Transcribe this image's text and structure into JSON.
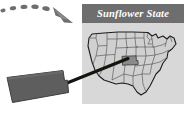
{
  "figure": {
    "kind": "state-callout-map-illustration",
    "background_color": "#ffffff",
    "width": 187,
    "height": 122
  },
  "panel": {
    "name": "sunflower-state-panel",
    "background_color": "#d8d8d8",
    "x": 82,
    "y": 4,
    "width": 102,
    "height": 100
  },
  "title_bar": {
    "label": "Sunflower State",
    "background_color": "#6e6e6e",
    "text_color": "#ffffff",
    "x": 82,
    "y": 4,
    "width": 102,
    "height": 19
  },
  "map": {
    "name": "united-states-map",
    "fill_color": "#d0d0d0",
    "outline_color": "#3a3a3a",
    "border_color": "#1c1c1c",
    "highlight": {
      "state": "Kansas",
      "fill_color": "#8a8a8a",
      "x": 122,
      "y": 56,
      "width": 16,
      "height": 9
    }
  },
  "callout": {
    "name": "kansas-shape-callout",
    "fill_color": "#5e5e5e",
    "stroke_color": "#3a3a3a",
    "x": 6,
    "y": 70,
    "width": 62,
    "height": 33
  },
  "leader_line": {
    "name": "callout-leader-line",
    "color": "#1a1a1a",
    "from_x": 63,
    "from_y": 84,
    "to_x": 127,
    "to_y": 59,
    "width": 3
  },
  "dashed_arrow": {
    "name": "dashed-curved-arrow",
    "color": "#6e6e6e",
    "dash_count": 6,
    "head": {
      "x": 56,
      "y": 6,
      "width": 18,
      "height": 17
    },
    "points": "3,10 14,7 26,6 38,7 48,10"
  },
  "icons": {
    "arrow": "dashed-arrow-icon",
    "map": "usa-map-icon",
    "state": "kansas-state-icon"
  }
}
